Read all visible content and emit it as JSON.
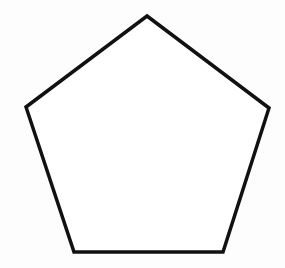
{
  "diagram": {
    "shape": "pentagon",
    "background_color": "#fdfdfd",
    "fill_color": "#ffffff",
    "stroke_color": "#111111",
    "stroke_width": 3.5,
    "vertices": [
      [
        147,
        16
      ],
      [
        269,
        108
      ],
      [
        223,
        252
      ],
      [
        74,
        252
      ],
      [
        26,
        107
      ]
    ],
    "points": "147,16 269,108 223,252 74,252 26,107"
  }
}
